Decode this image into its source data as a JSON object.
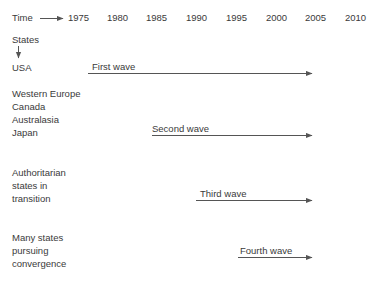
{
  "figure": {
    "background_color": "#ffffff",
    "text_color": "#3a3a3a",
    "line_color": "#555555"
  },
  "axis": {
    "time_label": "Time",
    "states_label": "States",
    "years": [
      "1975",
      "1980",
      "1985",
      "1990",
      "1995",
      "2000",
      "2005",
      "2010"
    ]
  },
  "rows": [
    {
      "id": "usa",
      "labels": [
        "USA"
      ]
    },
    {
      "id": "western-bloc",
      "labels": [
        "Western Europe",
        "Canada",
        "Australasia",
        "Japan"
      ]
    },
    {
      "id": "authoritarian",
      "labels": [
        "Authoritarian",
        "states in",
        "transition"
      ]
    },
    {
      "id": "convergence",
      "labels": [
        "Many states",
        "pursuing",
        "convergence"
      ]
    }
  ],
  "waves": [
    {
      "id": "first",
      "label": "First wave",
      "start_year": "1975",
      "end_year": "2010"
    },
    {
      "id": "second",
      "label": "Second wave",
      "start_year": "1985",
      "end_year": "2010"
    },
    {
      "id": "third",
      "label": "Third wave",
      "start_year": "1990",
      "end_year": "2010"
    },
    {
      "id": "fourth",
      "label": "Fourth wave",
      "start_year": "2000",
      "end_year": "2010"
    }
  ]
}
